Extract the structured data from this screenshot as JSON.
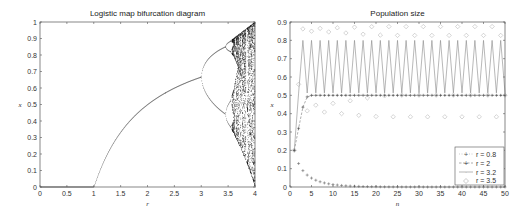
{
  "chart_data": [
    {
      "type": "scatter",
      "title": "Logistic map bifurcation diagram",
      "xlabel": "r",
      "ylabel": "x",
      "xlim": [
        0,
        4
      ],
      "ylim": [
        0,
        1
      ],
      "xticks": [
        "0",
        "0.5",
        "1",
        "1.5",
        "2",
        "2.5",
        "3",
        "3.5",
        "4"
      ],
      "yticks": [
        "0",
        "0.1",
        "0.2",
        "0.3",
        "0.4",
        "0.5",
        "0.6",
        "0.7",
        "0.8",
        "0.9",
        "1"
      ],
      "series": [
        {
          "name": "long-term x",
          "description": "attractor of x(n+1)=r x(n)(1-x(n)); x=0 for r<1, x=1-1/r for 1<r<3, period doubling from r=3, chaos beyond ~3.57"
        }
      ],
      "grid": false,
      "legend": null
    },
    {
      "type": "line",
      "title": "Population size",
      "xlabel": "n",
      "ylabel": "x",
      "xlim": [
        0,
        50
      ],
      "ylim": [
        0,
        0.9
      ],
      "xticks": [
        "0",
        "5",
        "10",
        "15",
        "20",
        "25",
        "30",
        "35",
        "40",
        "45",
        "50"
      ],
      "yticks": [
        "0",
        "0.1",
        "0.2",
        "0.3",
        "0.4",
        "0.5",
        "0.6",
        "0.7",
        "0.8",
        "0.9"
      ],
      "x0": 0.2,
      "series": [
        {
          "name": "r = 0.8",
          "r": 0.8,
          "marker": "+",
          "line": "none",
          "values_head": [
            0.2,
            0.128,
            0.0893,
            0.0651,
            0.0487,
            0.037,
            0.0285,
            0.0222,
            0.0173,
            0.0136,
            0.0107
          ]
        },
        {
          "name": "r = 2",
          "r": 2,
          "marker": "+",
          "line": "dashed",
          "values_head": [
            0.2,
            0.32,
            0.4352,
            0.4916,
            0.4999,
            0.5,
            0.5
          ]
        },
        {
          "name": "r = 3.2",
          "r": 3.2,
          "marker": "none",
          "line": "solid",
          "values_head": [
            0.2,
            0.512,
            0.7995,
            0.5129,
            0.7995,
            0.513,
            0.7995
          ]
        },
        {
          "name": "r = 3.5",
          "r": 3.5,
          "marker": "diamond",
          "line": "none",
          "values_head": [
            0.2,
            0.56,
            0.8624,
            0.4153,
            0.8499,
            0.4465,
            0.8649,
            0.4088,
            0.8459,
            0.5009,
            0.875,
            0.3828,
            0.8269,
            0.5009
          ]
        }
      ],
      "legend": {
        "position": "lower right",
        "entries": [
          "r = 0.8",
          "r = 2",
          "r = 3.2",
          "r = 3.5"
        ]
      },
      "grid": false
    }
  ]
}
